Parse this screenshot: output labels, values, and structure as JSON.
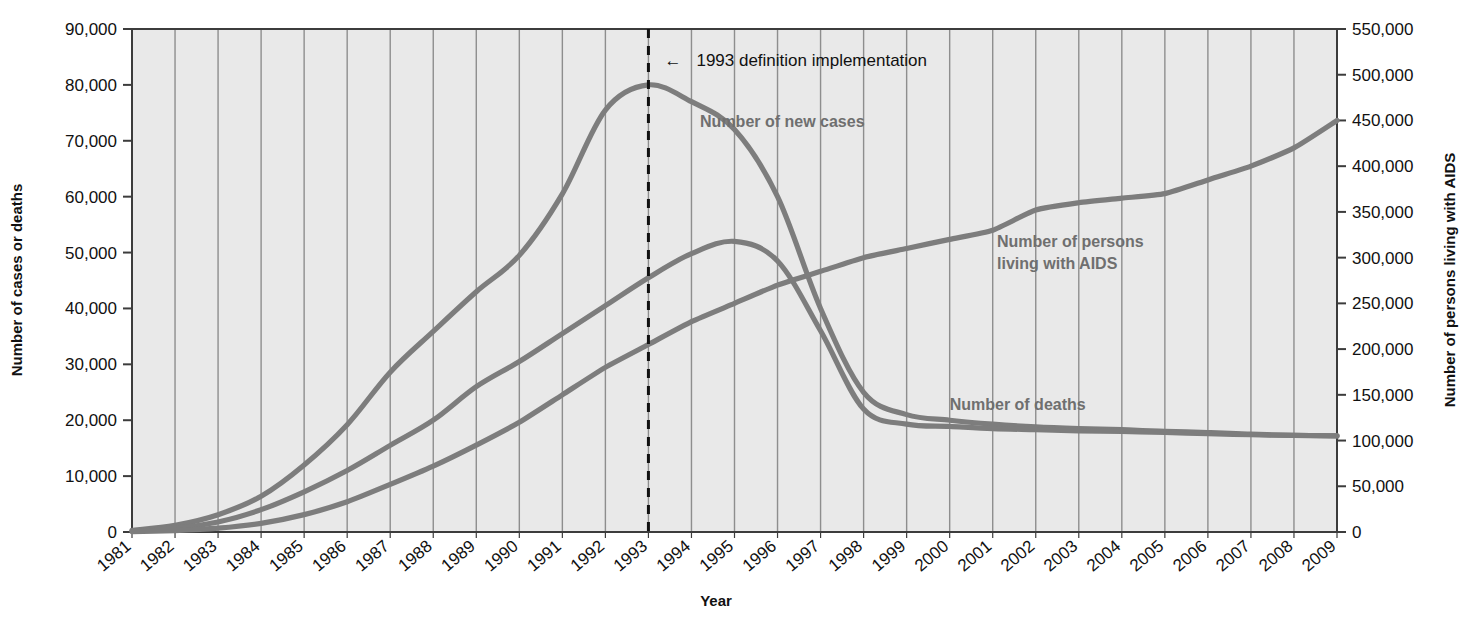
{
  "chart_data": {
    "type": "line",
    "title": "",
    "xlabel": "Year",
    "ylabel": "Number of cases or deaths",
    "y2label": "Number of persons living with AIDS",
    "grid": true,
    "legend_position": "inline-annotations",
    "categories": [
      "1981",
      "1982",
      "1983",
      "1984",
      "1985",
      "1986",
      "1987",
      "1988",
      "1989",
      "1990",
      "1991",
      "1992",
      "1993",
      "1994",
      "1995",
      "1996",
      "1997",
      "1998",
      "1999",
      "2000",
      "2001",
      "2002",
      "2003",
      "2004",
      "2005",
      "2006",
      "2007",
      "2008",
      "2009"
    ],
    "ylim": [
      0,
      90000
    ],
    "yticks": [
      0,
      10000,
      20000,
      30000,
      40000,
      50000,
      60000,
      70000,
      80000,
      90000
    ],
    "ytick_labels": [
      "0",
      "10,000",
      "20,000",
      "30,000",
      "40,000",
      "50,000",
      "60,000",
      "70,000",
      "80,000",
      "90,000"
    ],
    "y2lim": [
      0,
      550000
    ],
    "y2ticks": [
      0,
      50000,
      100000,
      150000,
      200000,
      250000,
      300000,
      350000,
      400000,
      450000,
      500000,
      550000
    ],
    "y2tick_labels": [
      "0",
      "50,000",
      "100,000",
      "150,000",
      "200,000",
      "250,000",
      "300,000",
      "350,000",
      "400,000",
      "450,000",
      "500,000",
      "550,000"
    ],
    "series": [
      {
        "name": "Number of new cases",
        "axis": "left",
        "color": "#7d7d7d",
        "label_x": 1994.2,
        "label_y": 72500,
        "values": [
          300,
          1200,
          3100,
          6400,
          12000,
          19200,
          28600,
          35900,
          43000,
          49500,
          60500,
          75500,
          80000,
          77000,
          72000,
          60000,
          40000,
          25000,
          21000,
          20000,
          19300,
          18800,
          18500,
          18300,
          18000,
          17800,
          17500,
          17300,
          17200
        ]
      },
      {
        "name": "Number of deaths",
        "axis": "left",
        "color": "#7d7d7d",
        "label_x": 2000.0,
        "label_y": 21800,
        "values": [
          200,
          700,
          1800,
          4000,
          7200,
          11000,
          15500,
          20000,
          26000,
          30500,
          35500,
          40500,
          45500,
          49800,
          52000,
          48500,
          36000,
          22000,
          19300,
          18900,
          18500,
          18300,
          18100,
          18000,
          17800,
          17600,
          17400,
          17300,
          17200
        ]
      },
      {
        "name": "Number of persons living with AIDS",
        "axis": "right",
        "color": "#7d7d7d",
        "label_x": 2001.1,
        "label_y": 51000,
        "values": [
          500,
          1600,
          4200,
          9500,
          19000,
          33000,
          52000,
          72000,
          95000,
          120000,
          150000,
          180000,
          205000,
          230000,
          250000,
          270000,
          285000,
          300000,
          310000,
          320000,
          330000,
          352000,
          360000,
          365000,
          370000,
          385000,
          400000,
          420000,
          450000
        ],
        "values_left_equivalent": [
          82,
          262,
          687,
          1554,
          3109,
          5400,
          8509,
          11782,
          15545,
          19636,
          24545,
          29455,
          33545,
          37636,
          40909,
          44182,
          46636,
          49091,
          50727,
          52364,
          54000,
          57600,
          58909,
          59727,
          60545,
          63000,
          65455,
          68727,
          73636
        ]
      }
    ],
    "annotations": [
      {
        "name": "1993-definition-implementation",
        "text": "1993 definition implementation",
        "arrow": "←",
        "x_year": 1993,
        "vline": true,
        "vline_style": "dashed",
        "label_y": 84500
      }
    ]
  },
  "colors": {
    "plot_background": "#e9e9e9",
    "gridline": "#7f7f7f",
    "axis": "#3c3c3c",
    "line": "#7d7d7d",
    "series_label": "#6f6f6f",
    "text": "#111111",
    "page_background": "#ffffff"
  }
}
